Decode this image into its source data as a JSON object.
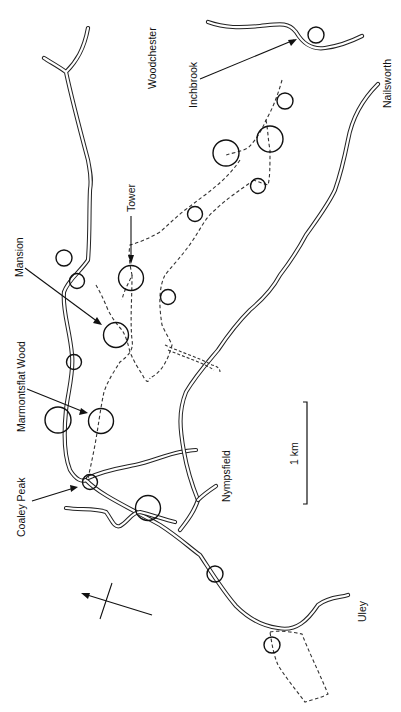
{
  "map": {
    "orientation": "rotated 90° clockwise (text reads bottom-to-top)",
    "labels": {
      "woodchester": "Woodchester",
      "inchbrook": "Inchbrook",
      "nailsworth": "Nailsworth",
      "tower": "Tower",
      "mansion": "Mansion",
      "marmontsflat_wood": "Marmontsflat Wood",
      "coaley_peak": "Coaley Peak",
      "nympsfield": "Nympsfield",
      "uley": "Uley"
    },
    "scale_bar": {
      "label": "1 km"
    },
    "north_arrow": {
      "icon": "north-arrow-icon"
    },
    "legend_symbols": {
      "road": "double line",
      "footpath": "dashed line",
      "site": "circle"
    },
    "colors": {
      "ink": "#111111",
      "background": "#ffffff"
    }
  }
}
